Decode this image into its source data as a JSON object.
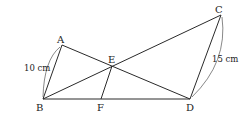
{
  "diagram": {
    "type": "geometry",
    "points": {
      "A": {
        "label": "A",
        "x": 62,
        "y": 45
      },
      "B": {
        "label": "B",
        "x": 43,
        "y": 99
      },
      "C": {
        "label": "C",
        "x": 221,
        "y": 15
      },
      "D": {
        "label": "D",
        "x": 190,
        "y": 99
      },
      "E": {
        "label": "E",
        "x": 112,
        "y": 66
      },
      "F": {
        "label": "F",
        "x": 101,
        "y": 99
      }
    },
    "segments": [
      "AB",
      "AD",
      "BC",
      "BD",
      "CD",
      "EF"
    ],
    "measurements": {
      "AB": "10 cm",
      "CD": "15 cm"
    }
  }
}
